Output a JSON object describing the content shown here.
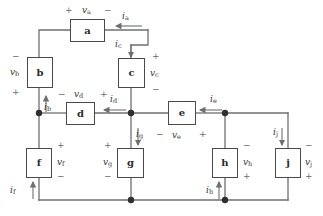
{
  "diagram": {
    "stroke_color": "#6f6f6f",
    "box_border_color": "#4a4a4a",
    "label_color": "#3a3a3a",
    "sign_color": "#6d6d6d",
    "background": "#ffffff"
  },
  "elements": [
    {
      "id": "a",
      "label": "a",
      "x": 70,
      "y": 19,
      "w": 35,
      "h": 23
    },
    {
      "id": "b",
      "label": "b",
      "x": 27,
      "y": 57,
      "w": 26,
      "h": 31
    },
    {
      "id": "c",
      "label": "c",
      "x": 118,
      "y": 58,
      "w": 27,
      "h": 30
    },
    {
      "id": "d",
      "label": "d",
      "x": 66,
      "y": 102,
      "w": 29,
      "h": 23
    },
    {
      "id": "e",
      "label": "e",
      "x": 168,
      "y": 101,
      "w": 28,
      "h": 24
    },
    {
      "id": "f",
      "label": "f",
      "x": 26,
      "y": 148,
      "w": 26,
      "h": 30
    },
    {
      "id": "g",
      "label": "g",
      "x": 117,
      "y": 148,
      "w": 27,
      "h": 30
    },
    {
      "id": "h",
      "label": "h",
      "x": 212,
      "y": 148,
      "w": 26,
      "h": 30
    },
    {
      "id": "j",
      "label": "j",
      "x": 275,
      "y": 148,
      "w": 26,
      "h": 30
    }
  ],
  "voltage_labels": [
    {
      "name": "v-a",
      "text": "v",
      "sub": "a",
      "x": 82,
      "y": 6
    },
    {
      "name": "v-b",
      "text": "v",
      "sub": "b",
      "x": 10,
      "y": 68
    },
    {
      "name": "v-c",
      "text": "v",
      "sub": "c",
      "x": 150,
      "y": 69
    },
    {
      "name": "v-d",
      "text": "v",
      "sub": "d",
      "x": 74,
      "y": 90
    },
    {
      "name": "v-e",
      "text": "v",
      "sub": "e",
      "x": 172,
      "y": 131
    },
    {
      "name": "v-f",
      "text": "v",
      "sub": "f",
      "x": 57,
      "y": 158
    },
    {
      "name": "v-g",
      "text": "v",
      "sub": "g",
      "x": 103,
      "y": 158
    },
    {
      "name": "v-h",
      "text": "v",
      "sub": "h",
      "x": 243,
      "y": 158
    },
    {
      "name": "v-j",
      "text": "v",
      "sub": "j",
      "x": 305,
      "y": 158
    }
  ],
  "current_labels": [
    {
      "name": "i-a",
      "text": "i",
      "sub": "a",
      "x": 122,
      "y": 12
    },
    {
      "name": "i-b",
      "text": "i",
      "sub": "b",
      "x": 44,
      "y": 103
    },
    {
      "name": "i-c",
      "text": "i",
      "sub": "c",
      "x": 115,
      "y": 40
    },
    {
      "name": "i-d",
      "text": "i",
      "sub": "d",
      "x": 110,
      "y": 95
    },
    {
      "name": "i-e",
      "text": "i",
      "sub": "e",
      "x": 210,
      "y": 95
    },
    {
      "name": "i-f",
      "text": "i",
      "sub": "f",
      "x": 10,
      "y": 186
    },
    {
      "name": "i-g",
      "text": "i",
      "sub": "g",
      "x": 136,
      "y": 130
    },
    {
      "name": "i-h",
      "text": "i",
      "sub": "h",
      "x": 206,
      "y": 186
    },
    {
      "name": "i-j",
      "text": "i",
      "sub": "j",
      "x": 273,
      "y": 128
    }
  ],
  "polarity_signs": [
    {
      "name": "plus-a-left",
      "sign": "+",
      "x": 65,
      "y": 6
    },
    {
      "name": "minus-a-right",
      "sign": "−",
      "x": 104,
      "y": 6
    },
    {
      "name": "minus-b-top",
      "sign": "−",
      "x": 12,
      "y": 52
    },
    {
      "name": "plus-b-bottom",
      "sign": "+",
      "x": 12,
      "y": 88
    },
    {
      "name": "plus-c-top",
      "sign": "+",
      "x": 152,
      "y": 52
    },
    {
      "name": "minus-c-bottom",
      "sign": "−",
      "x": 152,
      "y": 85
    },
    {
      "name": "minus-d-left",
      "sign": "−",
      "x": 58,
      "y": 90
    },
    {
      "name": "plus-d-right",
      "sign": "+",
      "x": 100,
      "y": 90
    },
    {
      "name": "minus-e-left",
      "sign": "−",
      "x": 156,
      "y": 130
    },
    {
      "name": "plus-e-right",
      "sign": "+",
      "x": 199,
      "y": 130
    },
    {
      "name": "plus-f-top",
      "sign": "+",
      "x": 57,
      "y": 141
    },
    {
      "name": "minus-f-bottom",
      "sign": "−",
      "x": 57,
      "y": 172
    },
    {
      "name": "plus-g-top",
      "sign": "+",
      "x": 104,
      "y": 141
    },
    {
      "name": "minus-g-bottom",
      "sign": "−",
      "x": 104,
      "y": 172
    },
    {
      "name": "minus-h-top",
      "sign": "−",
      "x": 243,
      "y": 141
    },
    {
      "name": "plus-h-bottom",
      "sign": "+",
      "x": 243,
      "y": 172
    },
    {
      "name": "minus-j-top",
      "sign": "−",
      "x": 305,
      "y": 141
    },
    {
      "name": "plus-j-bottom",
      "sign": "+",
      "x": 305,
      "y": 172
    }
  ],
  "nodes": [
    {
      "name": "node-left-mid",
      "cx": 39,
      "cy": 113,
      "r": 3.2
    },
    {
      "name": "node-center-mid",
      "cx": 131,
      "cy": 113,
      "r": 3.2
    },
    {
      "name": "node-right-mid",
      "cx": 225,
      "cy": 113,
      "r": 3.2
    },
    {
      "name": "node-center-bot",
      "cx": 131,
      "cy": 200,
      "r": 3.2
    },
    {
      "name": "node-right-bot",
      "cx": 225,
      "cy": 200,
      "r": 3.2
    }
  ],
  "wires": [
    {
      "name": "wire-b-top-to-a-left",
      "d": "M 39 57 L 39 30 L 70 30"
    },
    {
      "name": "wire-a-right-to-corner",
      "d": "M 105 30 L 148 30"
    },
    {
      "name": "wire-corner-down-to-c",
      "d": "M 148 30 L 148 45 L 131 45 L 131 58"
    },
    {
      "name": "wire-b-bottom-to-node",
      "d": "M 39 88 L 39 113"
    },
    {
      "name": "wire-c-bottom-to-node",
      "d": "M 131 88 L 131 113"
    },
    {
      "name": "wire-mid-left-to-d",
      "d": "M 39 113 L 66 113"
    },
    {
      "name": "wire-d-to-center-node",
      "d": "M 95 113 L 131 113"
    },
    {
      "name": "wire-center-node-to-e",
      "d": "M 131 113 L 168 113"
    },
    {
      "name": "wire-e-to-right-node",
      "d": "M 196 113 L 225 113"
    },
    {
      "name": "wire-right-node-to-rail",
      "d": "M 225 113 L 288 113"
    },
    {
      "name": "wire-rail-down-to-j",
      "d": "M 288 113 L 288 148"
    },
    {
      "name": "wire-left-node-down-to-f",
      "d": "M 39 113 L 39 148"
    },
    {
      "name": "wire-center-node-down-g",
      "d": "M 131 113 L 131 148"
    },
    {
      "name": "wire-right-node-down-h",
      "d": "M 225 113 L 225 148"
    },
    {
      "name": "wire-f-bottom-to-rail",
      "d": "M 39 178 L 39 200"
    },
    {
      "name": "wire-g-bottom-to-rail",
      "d": "M 131 178 L 131 200"
    },
    {
      "name": "wire-h-bottom-to-rail",
      "d": "M 225 178 L 225 200"
    },
    {
      "name": "wire-j-bottom-to-rail",
      "d": "M 288 178 L 288 200"
    },
    {
      "name": "wire-bottom-rail",
      "d": "M 39 200 L 288 200"
    }
  ],
  "arrows": [
    {
      "name": "arrow-i-a",
      "dir": "left",
      "x1": 142,
      "y1": 26,
      "x2": 116,
      "y2": 26
    },
    {
      "name": "arrow-i-c",
      "dir": "down",
      "x1": 131,
      "y1": 44,
      "x2": 131,
      "y2": 57
    },
    {
      "name": "arrow-i-b",
      "dir": "up",
      "x1": 46,
      "y1": 112,
      "x2": 46,
      "y2": 96
    },
    {
      "name": "arrow-i-d",
      "dir": "left",
      "x1": 126,
      "y1": 110,
      "x2": 104,
      "y2": 110
    },
    {
      "name": "arrow-i-e",
      "dir": "left",
      "x1": 222,
      "y1": 110,
      "x2": 200,
      "y2": 110
    },
    {
      "name": "arrow-i-g",
      "dir": "down",
      "x1": 138,
      "y1": 128,
      "x2": 138,
      "y2": 145
    },
    {
      "name": "arrow-i-j",
      "dir": "down",
      "x1": 282,
      "y1": 128,
      "x2": 282,
      "y2": 145
    },
    {
      "name": "arrow-i-f",
      "dir": "up",
      "x1": 33,
      "y1": 199,
      "x2": 33,
      "y2": 182
    },
    {
      "name": "arrow-i-h",
      "dir": "up",
      "x1": 219,
      "y1": 199,
      "x2": 219,
      "y2": 182
    }
  ]
}
